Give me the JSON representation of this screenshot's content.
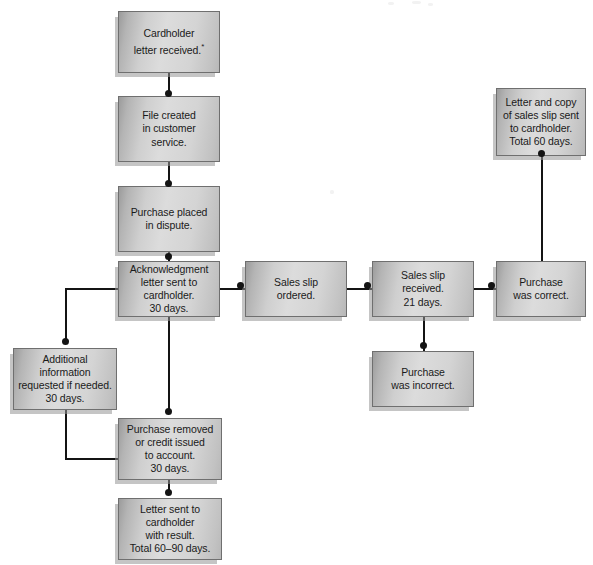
{
  "diagram": {
    "accent_color": "#d4d4d4",
    "border_color": "#6f6f6f",
    "connector_color": "#141414",
    "text_color": "#1a1a1a"
  },
  "nodes": [
    {
      "id": "cardholder-letter-received",
      "name": "node-cardholder-letter-received",
      "text": "Cardholder\nletter received.",
      "footnote": "*",
      "x": 118,
      "y": 11,
      "w": 102,
      "h": 62
    },
    {
      "id": "file-created",
      "name": "node-file-created",
      "text": "File created\nin customer\nservice.",
      "footnote": "",
      "x": 118,
      "y": 96,
      "w": 102,
      "h": 66
    },
    {
      "id": "purchase-placed-in-dispute",
      "name": "node-purchase-placed-in-dispute",
      "text": "Purchase placed\nin dispute.",
      "footnote": "",
      "x": 118,
      "y": 186,
      "w": 102,
      "h": 66
    },
    {
      "id": "acknowledgment-letter",
      "name": "node-acknowledgment-letter",
      "text": "Acknowledgment\nletter sent to\ncardholder.\n30 days.",
      "footnote": "",
      "x": 118,
      "y": 261,
      "w": 102,
      "h": 56
    },
    {
      "id": "sales-slip-ordered",
      "name": "node-sales-slip-ordered",
      "text": "Sales slip\nordered.",
      "footnote": "",
      "x": 245,
      "y": 261,
      "w": 102,
      "h": 56
    },
    {
      "id": "sales-slip-received",
      "name": "node-sales-slip-received",
      "text": "Sales slip\nreceived.\n21 days.",
      "footnote": "",
      "x": 372,
      "y": 261,
      "w": 102,
      "h": 56
    },
    {
      "id": "purchase-was-correct",
      "name": "node-purchase-was-correct",
      "text": "Purchase\nwas correct.",
      "footnote": "",
      "x": 496,
      "y": 261,
      "w": 90,
      "h": 56
    },
    {
      "id": "letter-and-copy-of-sales-slip",
      "name": "node-letter-and-copy-of-sales-slip",
      "text": "Letter and copy\nof sales slip sent\nto cardholder.\nTotal 60 days.",
      "footnote": "",
      "x": 496,
      "y": 88,
      "w": 90,
      "h": 68
    },
    {
      "id": "purchase-was-incorrect",
      "name": "node-purchase-was-incorrect",
      "text": "Purchase\nwas incorrect.",
      "footnote": "",
      "x": 372,
      "y": 351,
      "w": 102,
      "h": 56
    },
    {
      "id": "additional-information",
      "name": "node-additional-information",
      "text": "Additional\ninformation\nrequested if needed.\n30 days.",
      "footnote": "",
      "x": 13,
      "y": 348,
      "w": 104,
      "h": 62
    },
    {
      "id": "purchase-removed",
      "name": "node-purchase-removed",
      "text": "Purchase removed\nor credit issued\nto account.\n30 days.",
      "footnote": "",
      "x": 118,
      "y": 418,
      "w": 104,
      "h": 62
    },
    {
      "id": "letter-sent-with-result",
      "name": "node-letter-sent-with-result",
      "text": "Letter sent to\ncardholder\nwith result.\nTotal 60–90 days.",
      "footnote": "",
      "x": 118,
      "y": 498,
      "w": 104,
      "h": 62
    }
  ],
  "connectors": [
    {
      "name": "conn-cardholder-to-file",
      "segments": [
        {
          "o": "v",
          "x": 168,
          "y": 73,
          "len": 23
        }
      ],
      "dot": {
        "x": 168,
        "y": 93
      }
    },
    {
      "name": "conn-file-to-dispute",
      "segments": [
        {
          "o": "v",
          "x": 168,
          "y": 162,
          "len": 24
        }
      ],
      "dot": {
        "x": 168,
        "y": 183
      }
    },
    {
      "name": "conn-dispute-to-acknowledgment",
      "segments": [
        {
          "o": "v",
          "x": 168,
          "y": 252,
          "len": 9
        }
      ],
      "dot": {
        "x": 168,
        "y": 256
      }
    },
    {
      "name": "conn-acknowledgment-to-salesslip",
      "segments": [
        {
          "o": "h",
          "x": 220,
          "y": 288,
          "len": 25
        }
      ],
      "dot": {
        "x": 240,
        "y": 285
      }
    },
    {
      "name": "conn-salesslip-to-received",
      "segments": [
        {
          "o": "h",
          "x": 347,
          "y": 288,
          "len": 25
        }
      ],
      "dot": {
        "x": 367,
        "y": 285
      }
    },
    {
      "name": "conn-received-to-correct",
      "segments": [
        {
          "o": "h",
          "x": 474,
          "y": 288,
          "len": 22
        }
      ],
      "dot": {
        "x": 491,
        "y": 285
      }
    },
    {
      "name": "conn-correct-to-lettercopy",
      "segments": [
        {
          "o": "v",
          "x": 541,
          "y": 156,
          "len": 105
        }
      ],
      "dot": {
        "x": 541,
        "y": 153
      }
    },
    {
      "name": "conn-received-to-incorrect",
      "segments": [
        {
          "o": "v",
          "x": 423,
          "y": 317,
          "len": 34
        }
      ],
      "dot": {
        "x": 423,
        "y": 345
      }
    },
    {
      "name": "conn-acknowledgment-to-additional",
      "segments": [
        {
          "o": "h",
          "x": 65,
          "y": 288,
          "len": 54
        },
        {
          "o": "v",
          "x": 65,
          "y": 288,
          "len": 55
        }
      ],
      "dot": {
        "x": 65,
        "y": 341
      }
    },
    {
      "name": "conn-acknowledgment-to-removed",
      "segments": [
        {
          "o": "v",
          "x": 168,
          "y": 317,
          "len": 95
        }
      ],
      "dot": {
        "x": 168,
        "y": 411
      }
    },
    {
      "name": "conn-additional-to-removed",
      "segments": [
        {
          "o": "v",
          "x": 65,
          "y": 410,
          "len": 49
        },
        {
          "o": "h",
          "x": 65,
          "y": 458,
          "len": 54
        }
      ],
      "dot": null
    },
    {
      "name": "conn-removed-to-letterresult",
      "segments": [
        {
          "o": "v",
          "x": 168,
          "y": 480,
          "len": 15
        }
      ],
      "dot": {
        "x": 168,
        "y": 492
      }
    }
  ]
}
